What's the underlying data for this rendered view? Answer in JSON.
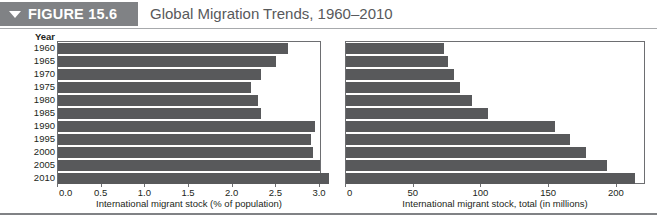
{
  "figure": {
    "tag_label": "FIGURE 15.6",
    "tag_icon": "triangle-down-icon",
    "title": "Global Migration Trends, 1960–2010",
    "header_color": "#808285",
    "bar_color": "#58595b"
  },
  "year_axis": {
    "header": "Year",
    "labels": [
      "1960",
      "1965",
      "1970",
      "1975",
      "1980",
      "1985",
      "1990",
      "1995",
      "2000",
      "2005",
      "2010"
    ]
  },
  "chart_data": [
    {
      "type": "bar",
      "orientation": "horizontal",
      "id": "migrant-stock-percent",
      "title": "International migrant stock (% of population)",
      "xlabel": "International migrant stock (% of population)",
      "ylabel": "Year",
      "categories": [
        "1960",
        "1965",
        "1970",
        "1975",
        "1980",
        "1985",
        "1990",
        "1995",
        "2000",
        "2005",
        "2010"
      ],
      "values": [
        2.63,
        2.5,
        2.33,
        2.21,
        2.29,
        2.33,
        2.94,
        2.9,
        2.92,
        3.0,
        3.1
      ],
      "xlim": [
        0.0,
        3.0
      ],
      "xticks": [
        0.0,
        0.5,
        1.0,
        1.5,
        2.0,
        2.5,
        3.0
      ],
      "xticklabels": [
        "0.0",
        "0.5",
        "1.0",
        "1.5",
        "2.0",
        "2.5",
        "3.0"
      ],
      "grid": false,
      "legend": false
    },
    {
      "type": "bar",
      "orientation": "horizontal",
      "id": "migrant-stock-total",
      "title": "International migrant stock, total (in millions)",
      "xlabel": "International migrant stock, total (in millions)",
      "ylabel": "Year",
      "categories": [
        "1960",
        "1965",
        "1970",
        "1975",
        "1980",
        "1985",
        "1990",
        "1995",
        "2000",
        "2005",
        "2010"
      ],
      "values": [
        72,
        75,
        80,
        84,
        93,
        105,
        154,
        165,
        177,
        193,
        213
      ],
      "xlim": [
        0,
        220
      ],
      "xticks": [
        0,
        50,
        100,
        150,
        200
      ],
      "xticklabels": [
        "0",
        "50",
        "100",
        "150",
        "200"
      ],
      "grid": false,
      "legend": false
    }
  ]
}
